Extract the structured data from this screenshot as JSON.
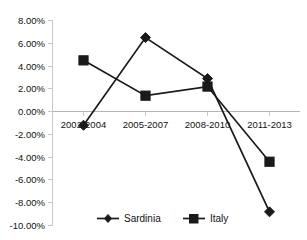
{
  "chart_data": {
    "type": "line",
    "title": "",
    "xlabel": "",
    "ylabel": "",
    "categories": [
      "2002-2004",
      "2005-2007",
      "2008-2010",
      "2011-2013"
    ],
    "series": [
      {
        "name": "Sardinia",
        "marker": "diamond",
        "color": "#1a1a1a",
        "values": [
          -1.2,
          6.5,
          2.9,
          -8.8
        ],
        "values_text": [
          "-1.20%",
          "6.50%",
          "2.90%",
          "-8.80%"
        ]
      },
      {
        "name": "Italy",
        "marker": "square",
        "color": "#1a1a1a",
        "values": [
          4.5,
          1.4,
          2.2,
          -4.4
        ],
        "values_text": [
          "4.50%",
          "1.40%",
          "2.20%",
          "-4.40%"
        ]
      }
    ],
    "ylim": [
      -10,
      8
    ],
    "ytick_values": [
      8,
      6,
      4,
      2,
      0,
      -2,
      -4,
      -6,
      -8,
      -10
    ],
    "ytick_labels": [
      "8.00%",
      "6.00%",
      "4.00%",
      "2.00%",
      "0.00%",
      "-2.00%",
      "-4.00%",
      "-6.00%",
      "-8.00%",
      "-10.00%"
    ],
    "grid": false,
    "legend_position": "bottom",
    "legend_entries": [
      "Sardinia",
      "Italy"
    ],
    "axis_color": "#c8c8c8",
    "zero_line_color": "#b4b4b4",
    "background_color": "#ffffff"
  },
  "yticks": {
    "t0": "8.00%",
    "t1": "6.00%",
    "t2": "4.00%",
    "t3": "2.00%",
    "t4": "0.00%",
    "t5": "-2.00%",
    "t6": "-4.00%",
    "t7": "-6.00%",
    "t8": "-8.00%",
    "t9": "-10.00%"
  },
  "xticks": {
    "t0": "2002-2004",
    "t1": "2005-2007",
    "t2": "2008-2010",
    "t3": "2011-2013"
  },
  "legend": {
    "sardinia": "Sardinia",
    "italy": "Italy"
  }
}
